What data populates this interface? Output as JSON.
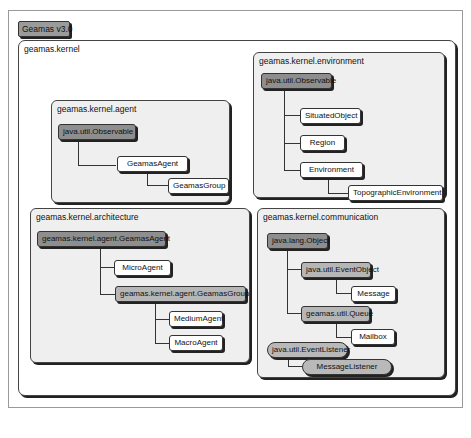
{
  "diagram": {
    "title": "Geamas v3.0",
    "root_package": "geamas.kernel",
    "packages": {
      "agent": {
        "name": "geamas.kernel.agent",
        "nodes": [
          "java.util.Observable",
          "GeamasAgent",
          "GeamasGroup"
        ]
      },
      "environment": {
        "name": "geamas.kernel.environment",
        "nodes": [
          "java.util.Observable",
          "SituatedObject",
          "Region",
          "Environment",
          "TopographicEnvironment"
        ]
      },
      "architecture": {
        "name": "geamas.kernel.architecture",
        "nodes": [
          "geamas.kernel.agent.GeamasAgent",
          "MicroAgent",
          "geamas.kernel.agent.GeamasGroup",
          "MediumAgent",
          "MacroAgent"
        ]
      },
      "communication": {
        "name": "geamas.kernel.communication",
        "nodes": [
          "java.lang.Object",
          "java.util.EventObject",
          "Message",
          "geamas.util.Queue",
          "Mailbox",
          "java.util.EventListener",
          "MessageListener"
        ]
      }
    },
    "colors": {
      "external_class": "#8e8e8e",
      "intermediate_class": "#b6b6b6",
      "class": "#ffffff",
      "interface": "#b9b9b9",
      "panel_bg": "#efefef"
    }
  }
}
